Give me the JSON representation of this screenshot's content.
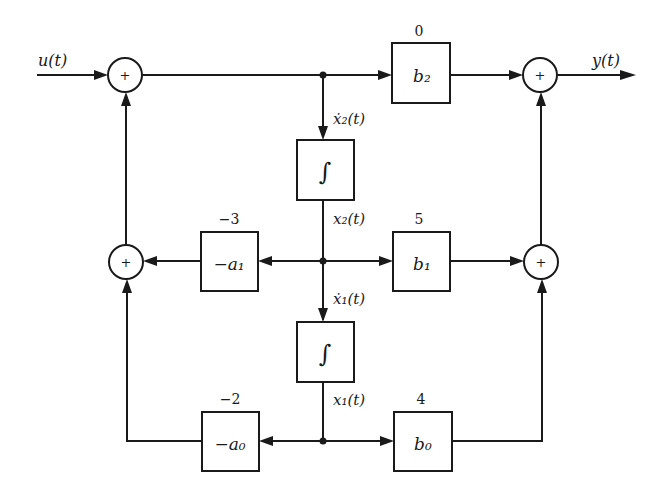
{
  "diagram": {
    "colors": {
      "line": "#1a1a1a",
      "background": "#ffffff"
    },
    "signals": {
      "input": "u(t)",
      "output": "y(t)",
      "x2dot": "ẋ₂(t)",
      "x2": "x₂(t)",
      "x1dot": "ẋ₁(t)",
      "x1": "x₁(t)"
    },
    "summers": {
      "input_sum": "+",
      "feedback_sum": "+",
      "output_sum_top": "+",
      "output_sum_mid": "+"
    },
    "integrators": {
      "upper": "∫",
      "lower": "∫"
    },
    "gains": {
      "b2": {
        "label": "b₂",
        "value": "0"
      },
      "b1": {
        "label": "b₁",
        "value": "5"
      },
      "b0": {
        "label": "b₀",
        "value": "4"
      },
      "neg_a1": {
        "label": "−a₁",
        "value": "−3"
      },
      "neg_a0": {
        "label": "−a₀",
        "value": "−2"
      }
    }
  }
}
